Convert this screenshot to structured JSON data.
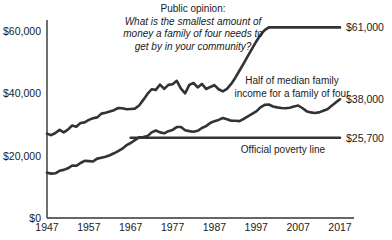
{
  "chart_data": {
    "type": "line",
    "title": "",
    "xlabel": "",
    "ylabel": "",
    "xlim": [
      1947,
      2017
    ],
    "ylim": [
      0,
      65000
    ],
    "grid": false,
    "legend_position": "inline-annotations",
    "y_ticks": [
      "$0",
      "$20,000",
      "$40,000",
      "$60,000"
    ],
    "y_tick_values": [
      0,
      20000,
      40000,
      60000
    ],
    "x_ticks": [
      "1947",
      "1957",
      "1967",
      "1977",
      "1987",
      "1997",
      "2007",
      "2017"
    ],
    "x_tick_values": [
      1947,
      1957,
      1967,
      1977,
      1987,
      1997,
      2007,
      2017
    ],
    "annotations": [
      {
        "name": "public-opinion-question",
        "lines": [
          "Public opinion:",
          "What is the smallest amount of",
          "money a family of four needs to",
          "get by in your community?"
        ],
        "italic_from_line": 1
      },
      {
        "name": "median-income-label",
        "lines": [
          "Half of median family",
          "income for a family of four"
        ],
        "italic_from_line": 99
      },
      {
        "name": "poverty-line-label",
        "lines": [
          "Official poverty line"
        ],
        "italic_from_line": 99
      }
    ],
    "end_labels": [
      {
        "name": "public-opinion-end-label",
        "text": "$61,000",
        "value": 61000
      },
      {
        "name": "median-income-end-label",
        "text": "$38,000",
        "value": 38000
      },
      {
        "name": "poverty-line-end-label",
        "text": "$25,700",
        "value": 25700
      }
    ],
    "series": [
      {
        "name": "Public opinion: smallest amount needed to get by",
        "x": [
          1947,
          1948,
          1949,
          1950,
          1951,
          1952,
          1953,
          1954,
          1955,
          1956,
          1957,
          1958,
          1959,
          1960,
          1961,
          1962,
          1963,
          1964,
          1965,
          1966,
          1967,
          1968,
          1969,
          1970,
          1971,
          1972,
          1973,
          1974,
          1975,
          1976,
          1977,
          1978,
          1979,
          1980,
          1981,
          1982,
          1983,
          1984,
          1985,
          1986,
          1987,
          1988,
          1989,
          1990,
          1991,
          1992,
          1993,
          1994,
          1995,
          1996,
          1997,
          1998,
          1999,
          2000,
          2001,
          2002,
          2003,
          2004,
          2005,
          2006,
          2007,
          2008,
          2009,
          2010,
          2011,
          2012,
          2013,
          2014,
          2015,
          2016,
          2017
        ],
        "values": [
          27000,
          26500,
          27200,
          28200,
          27400,
          28300,
          29600,
          29200,
          30400,
          30600,
          31400,
          31900,
          32200,
          33400,
          33700,
          34100,
          34500,
          35200,
          35100,
          34800,
          34900,
          35000,
          36000,
          37800,
          39700,
          41200,
          41000,
          42700,
          41300,
          42600,
          42800,
          43900,
          41400,
          39900,
          42600,
          43200,
          41800,
          42900,
          41300,
          41900,
          42500,
          41200,
          40500,
          41300,
          42900,
          44900,
          47200,
          49500,
          51900,
          54200,
          56500,
          58600,
          60100,
          61000,
          61000,
          61000,
          61000,
          61000,
          61000,
          61000,
          61000,
          61000,
          61000,
          61000,
          61000,
          61000,
          61000,
          61000,
          61000,
          61000,
          61000
        ]
      },
      {
        "name": "Half of median family income for a family of four",
        "x": [
          1947,
          1948,
          1949,
          1950,
          1951,
          1952,
          1953,
          1954,
          1955,
          1956,
          1957,
          1958,
          1959,
          1960,
          1961,
          1962,
          1963,
          1964,
          1965,
          1966,
          1967,
          1968,
          1969,
          1970,
          1971,
          1972,
          1973,
          1974,
          1975,
          1976,
          1977,
          1978,
          1979,
          1980,
          1981,
          1982,
          1983,
          1984,
          1985,
          1986,
          1987,
          1988,
          1989,
          1990,
          1991,
          1992,
          1993,
          1994,
          1995,
          1996,
          1997,
          1998,
          1999,
          2000,
          2001,
          2002,
          2003,
          2004,
          2005,
          2006,
          2007,
          2008,
          2009,
          2010,
          2011,
          2012,
          2013,
          2014,
          2015,
          2016,
          2017
        ],
        "values": [
          14500,
          14200,
          14300,
          15100,
          15400,
          15900,
          16800,
          16700,
          17600,
          18300,
          18200,
          18100,
          19000,
          19300,
          19600,
          20100,
          20700,
          21400,
          22200,
          23300,
          24000,
          24900,
          25800,
          25900,
          26200,
          27400,
          28000,
          27400,
          27100,
          27800,
          28200,
          29100,
          29100,
          28100,
          27800,
          27600,
          27900,
          28800,
          29400,
          30400,
          31000,
          31400,
          32000,
          31600,
          31100,
          31100,
          31000,
          31700,
          32500,
          33300,
          34100,
          35400,
          36200,
          36300,
          35700,
          35400,
          35200,
          35100,
          35300,
          35700,
          36000,
          35200,
          34200,
          33800,
          33600,
          33800,
          34300,
          34800,
          35900,
          37000,
          38000
        ]
      },
      {
        "name": "Official poverty line",
        "x": [
          1967,
          1977,
          1987,
          1997,
          2007,
          2017
        ],
        "values": [
          25700,
          25700,
          25700,
          25700,
          25700,
          25700
        ]
      }
    ]
  }
}
